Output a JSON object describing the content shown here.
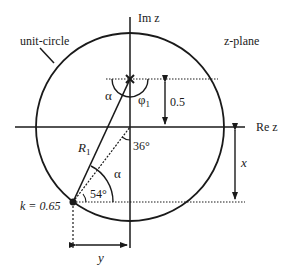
{
  "diagram": {
    "type": "complex-plane-geometry",
    "plane_label": "z-plane",
    "circle_label": "unit-circle",
    "axes": {
      "imaginary": "Im z",
      "real": "Re z"
    },
    "pole": {
      "marker": "×",
      "height_label": "0.5",
      "angle_label": "φ",
      "angle_subscript": "1",
      "alpha_label": "α"
    },
    "point_k": {
      "label": "k = 0.65"
    },
    "radius_label": "R",
    "radius_subscript": "1",
    "angles": {
      "upper": "36°",
      "lower": "54°",
      "alpha": "α"
    },
    "dimensions": {
      "vertical": "x",
      "horizontal": "y"
    }
  },
  "colors": {
    "ink": "#1a1a1a",
    "background": "#ffffff"
  }
}
